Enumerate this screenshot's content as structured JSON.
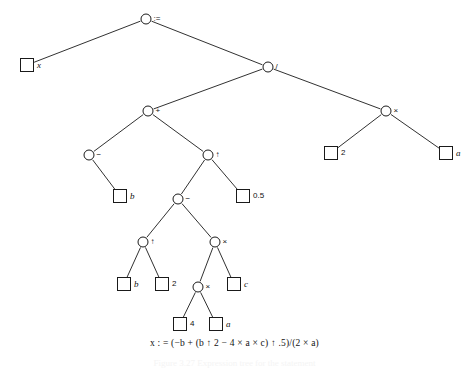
{
  "figure": {
    "kind": "expression-tree",
    "width": 469,
    "height": 368,
    "background": "#ffffff",
    "ink": "#1a1a1a"
  },
  "formula": {
    "text": "x : = (−b + (b ↑ 2 − 4 × a × c) ↑ .5)/(2 × a)",
    "x": 234,
    "y": 344
  },
  "caption": {
    "text": "Figure 3.27 Expression tree for the statement",
    "x": 234,
    "y": 364
  },
  "nodes": [
    {
      "id": "n0",
      "type": "op",
      "label": ":=",
      "x": 146,
      "y": 19,
      "labelclass": "op"
    },
    {
      "id": "n1",
      "type": "leaf",
      "label": "x",
      "x": 27,
      "y": 65,
      "labelclass": "ital"
    },
    {
      "id": "n2",
      "type": "op",
      "label": "/",
      "x": 268,
      "y": 67,
      "labelclass": "op"
    },
    {
      "id": "n3",
      "type": "op",
      "label": "+",
      "x": 148,
      "y": 111,
      "labelclass": "op"
    },
    {
      "id": "n4",
      "type": "op",
      "label": "×",
      "x": 386,
      "y": 111,
      "labelclass": "op"
    },
    {
      "id": "n5",
      "type": "leaf",
      "label": "2",
      "x": 331,
      "y": 153,
      "labelclass": "num"
    },
    {
      "id": "n6",
      "type": "leaf",
      "label": "a",
      "x": 446,
      "y": 153,
      "labelclass": "ital"
    },
    {
      "id": "n7",
      "type": "op",
      "label": "−",
      "x": 89,
      "y": 155,
      "labelclass": "op"
    },
    {
      "id": "n8",
      "type": "op",
      "label": "↑",
      "x": 208,
      "y": 155,
      "labelclass": "op"
    },
    {
      "id": "n9",
      "type": "leaf",
      "label": "b",
      "x": 120,
      "y": 196,
      "labelclass": "ital"
    },
    {
      "id": "n10",
      "type": "leaf",
      "label": "0.5",
      "x": 243,
      "y": 196,
      "labelclass": "num"
    },
    {
      "id": "n11",
      "type": "op",
      "label": "−",
      "x": 178,
      "y": 199,
      "labelclass": "op"
    },
    {
      "id": "n12",
      "type": "op",
      "label": "↑",
      "x": 143,
      "y": 242,
      "labelclass": "op"
    },
    {
      "id": "n13",
      "type": "op",
      "label": "×",
      "x": 215,
      "y": 242,
      "labelclass": "op"
    },
    {
      "id": "n14",
      "type": "leaf",
      "label": "b",
      "x": 124,
      "y": 284,
      "labelclass": "ital"
    },
    {
      "id": "n15",
      "type": "leaf",
      "label": "2",
      "x": 162,
      "y": 284,
      "labelclass": "num"
    },
    {
      "id": "n16",
      "type": "op",
      "label": "×",
      "x": 198,
      "y": 287,
      "labelclass": "op"
    },
    {
      "id": "n17",
      "type": "leaf",
      "label": "c",
      "x": 234,
      "y": 284,
      "labelclass": "ital"
    },
    {
      "id": "n18",
      "type": "leaf",
      "label": "4",
      "x": 180,
      "y": 324,
      "labelclass": "num"
    },
    {
      "id": "n19",
      "type": "leaf",
      "label": "a",
      "x": 216,
      "y": 324,
      "labelclass": "ital"
    }
  ],
  "edges": [
    {
      "from": "n0",
      "to": "n1"
    },
    {
      "from": "n0",
      "to": "n2"
    },
    {
      "from": "n2",
      "to": "n3"
    },
    {
      "from": "n2",
      "to": "n4"
    },
    {
      "from": "n4",
      "to": "n5"
    },
    {
      "from": "n4",
      "to": "n6"
    },
    {
      "from": "n3",
      "to": "n7"
    },
    {
      "from": "n3",
      "to": "n8"
    },
    {
      "from": "n7",
      "to": "n9"
    },
    {
      "from": "n8",
      "to": "n11"
    },
    {
      "from": "n8",
      "to": "n10"
    },
    {
      "from": "n11",
      "to": "n12"
    },
    {
      "from": "n11",
      "to": "n13"
    },
    {
      "from": "n12",
      "to": "n14"
    },
    {
      "from": "n12",
      "to": "n15"
    },
    {
      "from": "n13",
      "to": "n16"
    },
    {
      "from": "n13",
      "to": "n17"
    },
    {
      "from": "n16",
      "to": "n18"
    },
    {
      "from": "n16",
      "to": "n19"
    }
  ]
}
